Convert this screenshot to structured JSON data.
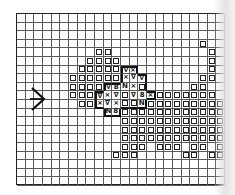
{
  "chart_data": {
    "type": "stitch-chart",
    "grid": {
      "cols": 24,
      "rows": 20
    },
    "legend_symbols": {
      "sq": "□",
      "x": "×",
      "v": "∇",
      "8": "8",
      "n": "N"
    },
    "row_marker": {
      "symbol": ">",
      "row": 9
    },
    "cells": [
      {
        "r": 3,
        "c": 21,
        "s": "sq"
      },
      {
        "r": 4,
        "c": 9,
        "s": "sq"
      },
      {
        "r": 4,
        "c": 10,
        "s": "sq"
      },
      {
        "r": 4,
        "c": 22,
        "s": "sq"
      },
      {
        "r": 5,
        "c": 8,
        "s": "sq"
      },
      {
        "r": 5,
        "c": 9,
        "s": "sq"
      },
      {
        "r": 5,
        "c": 10,
        "s": "sq"
      },
      {
        "r": 5,
        "c": 11,
        "s": "sq"
      },
      {
        "r": 5,
        "c": 22,
        "s": "sq"
      },
      {
        "r": 6,
        "c": 7,
        "s": "sq"
      },
      {
        "r": 6,
        "c": 8,
        "s": "sq"
      },
      {
        "r": 6,
        "c": 9,
        "s": "sq"
      },
      {
        "r": 6,
        "c": 10,
        "s": "sq"
      },
      {
        "r": 6,
        "c": 11,
        "s": "sq"
      },
      {
        "r": 6,
        "c": 12,
        "s": "v"
      },
      {
        "r": 6,
        "c": 13,
        "s": "x"
      },
      {
        "r": 6,
        "c": 22,
        "s": "sq"
      },
      {
        "r": 7,
        "c": 6,
        "s": "sq"
      },
      {
        "r": 7,
        "c": 7,
        "s": "sq"
      },
      {
        "r": 7,
        "c": 8,
        "s": "sq"
      },
      {
        "r": 7,
        "c": 9,
        "s": "sq"
      },
      {
        "r": 7,
        "c": 10,
        "s": "sq"
      },
      {
        "r": 7,
        "c": 11,
        "s": "sq"
      },
      {
        "r": 7,
        "c": 12,
        "s": "x"
      },
      {
        "r": 7,
        "c": 13,
        "s": "v"
      },
      {
        "r": 7,
        "c": 14,
        "s": "v"
      },
      {
        "r": 7,
        "c": 21,
        "s": "sq"
      },
      {
        "r": 7,
        "c": 22,
        "s": "sq"
      },
      {
        "r": 8,
        "c": 6,
        "s": "sq"
      },
      {
        "r": 8,
        "c": 7,
        "s": "sq"
      },
      {
        "r": 8,
        "c": 8,
        "s": "sq"
      },
      {
        "r": 8,
        "c": 9,
        "s": "sq"
      },
      {
        "r": 8,
        "c": 10,
        "s": "v"
      },
      {
        "r": 8,
        "c": 11,
        "s": "8"
      },
      {
        "r": 8,
        "c": 12,
        "s": "n"
      },
      {
        "r": 8,
        "c": 13,
        "s": "x"
      },
      {
        "r": 8,
        "c": 14,
        "s": "sq"
      },
      {
        "r": 8,
        "c": 20,
        "s": "sq"
      },
      {
        "r": 8,
        "c": 21,
        "s": "sq"
      },
      {
        "r": 9,
        "c": 6,
        "s": "sq"
      },
      {
        "r": 9,
        "c": 7,
        "s": "sq"
      },
      {
        "r": 9,
        "c": 8,
        "s": "sq"
      },
      {
        "r": 9,
        "c": 9,
        "s": "v"
      },
      {
        "r": 9,
        "c": 10,
        "s": "x"
      },
      {
        "r": 9,
        "c": 11,
        "s": "v"
      },
      {
        "r": 9,
        "c": 12,
        "s": "sq"
      },
      {
        "r": 9,
        "c": 13,
        "s": "v"
      },
      {
        "r": 9,
        "c": 14,
        "s": "8"
      },
      {
        "r": 9,
        "c": 15,
        "s": "x"
      },
      {
        "r": 9,
        "c": 16,
        "s": "sq"
      },
      {
        "r": 9,
        "c": 17,
        "s": "sq"
      },
      {
        "r": 9,
        "c": 18,
        "s": "sq"
      },
      {
        "r": 9,
        "c": 19,
        "s": "sq"
      },
      {
        "r": 9,
        "c": 20,
        "s": "sq"
      },
      {
        "r": 9,
        "c": 21,
        "s": "sq"
      },
      {
        "r": 9,
        "c": 22,
        "s": "sq"
      },
      {
        "r": 10,
        "c": 7,
        "s": "sq"
      },
      {
        "r": 10,
        "c": 8,
        "s": "sq"
      },
      {
        "r": 10,
        "c": 9,
        "s": "x"
      },
      {
        "r": 10,
        "c": 10,
        "s": "v"
      },
      {
        "r": 10,
        "c": 11,
        "s": "x"
      },
      {
        "r": 10,
        "c": 12,
        "s": "sq"
      },
      {
        "r": 10,
        "c": 13,
        "s": "sq"
      },
      {
        "r": 10,
        "c": 14,
        "s": "n"
      },
      {
        "r": 10,
        "c": 15,
        "s": "sq"
      },
      {
        "r": 10,
        "c": 16,
        "s": "sq"
      },
      {
        "r": 10,
        "c": 17,
        "s": "sq"
      },
      {
        "r": 10,
        "c": 18,
        "s": "sq"
      },
      {
        "r": 10,
        "c": 19,
        "s": "sq"
      },
      {
        "r": 10,
        "c": 20,
        "s": "sq"
      },
      {
        "r": 10,
        "c": 21,
        "s": "sq"
      },
      {
        "r": 10,
        "c": 22,
        "s": "sq"
      },
      {
        "r": 10,
        "c": 23,
        "s": "sq"
      },
      {
        "r": 11,
        "c": 10,
        "s": "n"
      },
      {
        "r": 11,
        "c": 11,
        "s": "8"
      },
      {
        "r": 11,
        "c": 12,
        "s": "sq"
      },
      {
        "r": 11,
        "c": 13,
        "s": "sq"
      },
      {
        "r": 11,
        "c": 14,
        "s": "sq"
      },
      {
        "r": 11,
        "c": 15,
        "s": "sq"
      },
      {
        "r": 11,
        "c": 16,
        "s": "sq"
      },
      {
        "r": 11,
        "c": 17,
        "s": "sq"
      },
      {
        "r": 11,
        "c": 18,
        "s": "sq"
      },
      {
        "r": 11,
        "c": 19,
        "s": "sq"
      },
      {
        "r": 11,
        "c": 20,
        "s": "sq"
      },
      {
        "r": 11,
        "c": 21,
        "s": "sq"
      },
      {
        "r": 11,
        "c": 22,
        "s": "sq"
      },
      {
        "r": 11,
        "c": 23,
        "s": "sq"
      },
      {
        "r": 12,
        "c": 12,
        "s": "sq"
      },
      {
        "r": 12,
        "c": 13,
        "s": "sq"
      },
      {
        "r": 12,
        "c": 14,
        "s": "sq"
      },
      {
        "r": 12,
        "c": 15,
        "s": "sq"
      },
      {
        "r": 12,
        "c": 16,
        "s": "sq"
      },
      {
        "r": 12,
        "c": 17,
        "s": "sq"
      },
      {
        "r": 12,
        "c": 18,
        "s": "sq"
      },
      {
        "r": 12,
        "c": 19,
        "s": "sq"
      },
      {
        "r": 12,
        "c": 20,
        "s": "sq"
      },
      {
        "r": 12,
        "c": 21,
        "s": "sq"
      },
      {
        "r": 12,
        "c": 22,
        "s": "sq"
      },
      {
        "r": 12,
        "c": 23,
        "s": "sq"
      },
      {
        "r": 13,
        "c": 12,
        "s": "sq"
      },
      {
        "r": 13,
        "c": 13,
        "s": "sq"
      },
      {
        "r": 13,
        "c": 14,
        "s": "sq"
      },
      {
        "r": 13,
        "c": 15,
        "s": "sq"
      },
      {
        "r": 13,
        "c": 16,
        "s": "sq"
      },
      {
        "r": 13,
        "c": 17,
        "s": "sq"
      },
      {
        "r": 13,
        "c": 18,
        "s": "sq"
      },
      {
        "r": 13,
        "c": 19,
        "s": "sq"
      },
      {
        "r": 13,
        "c": 20,
        "s": "sq"
      },
      {
        "r": 13,
        "c": 21,
        "s": "sq"
      },
      {
        "r": 13,
        "c": 22,
        "s": "sq"
      },
      {
        "r": 13,
        "c": 23,
        "s": "sq"
      },
      {
        "r": 14,
        "c": 12,
        "s": "sq"
      },
      {
        "r": 14,
        "c": 13,
        "s": "sq"
      },
      {
        "r": 14,
        "c": 14,
        "s": "sq"
      },
      {
        "r": 14,
        "c": 15,
        "s": "sq"
      },
      {
        "r": 14,
        "c": 16,
        "s": "sq"
      },
      {
        "r": 14,
        "c": 17,
        "s": "sq"
      },
      {
        "r": 14,
        "c": 18,
        "s": "sq"
      },
      {
        "r": 14,
        "c": 19,
        "s": "sq"
      },
      {
        "r": 14,
        "c": 20,
        "s": "sq"
      },
      {
        "r": 14,
        "c": 21,
        "s": "sq"
      },
      {
        "r": 14,
        "c": 22,
        "s": "sq"
      },
      {
        "r": 14,
        "c": 23,
        "s": "sq"
      },
      {
        "r": 15,
        "c": 12,
        "s": "sq"
      },
      {
        "r": 15,
        "c": 13,
        "s": "sq"
      },
      {
        "r": 15,
        "c": 14,
        "s": "sq"
      },
      {
        "r": 15,
        "c": 16,
        "s": "sq"
      },
      {
        "r": 15,
        "c": 17,
        "s": "sq"
      },
      {
        "r": 15,
        "c": 18,
        "s": "sq"
      },
      {
        "r": 15,
        "c": 20,
        "s": "sq"
      },
      {
        "r": 15,
        "c": 21,
        "s": "sq"
      },
      {
        "r": 15,
        "c": 23,
        "s": "sq"
      },
      {
        "r": 16,
        "c": 11,
        "s": "sq"
      },
      {
        "r": 16,
        "c": 12,
        "s": "sq"
      },
      {
        "r": 16,
        "c": 13,
        "s": "sq"
      },
      {
        "r": 16,
        "c": 19,
        "s": "sq"
      },
      {
        "r": 16,
        "c": 20,
        "s": "sq"
      },
      {
        "r": 16,
        "c": 22,
        "s": "sq"
      },
      {
        "r": 16,
        "c": 23,
        "s": "sq"
      }
    ],
    "outlined_region": [
      [
        6,
        12
      ],
      [
        6,
        13
      ],
      [
        7,
        12
      ],
      [
        7,
        13
      ],
      [
        7,
        14
      ],
      [
        8,
        10
      ],
      [
        8,
        11
      ],
      [
        8,
        12
      ],
      [
        8,
        13
      ],
      [
        8,
        14
      ],
      [
        9,
        9
      ],
      [
        9,
        10
      ],
      [
        9,
        11
      ],
      [
        9,
        12
      ],
      [
        9,
        13
      ],
      [
        9,
        14
      ],
      [
        9,
        15
      ],
      [
        10,
        9
      ],
      [
        10,
        10
      ],
      [
        10,
        11
      ],
      [
        10,
        12
      ],
      [
        10,
        13
      ],
      [
        10,
        14
      ],
      [
        11,
        10
      ],
      [
        11,
        11
      ]
    ]
  }
}
